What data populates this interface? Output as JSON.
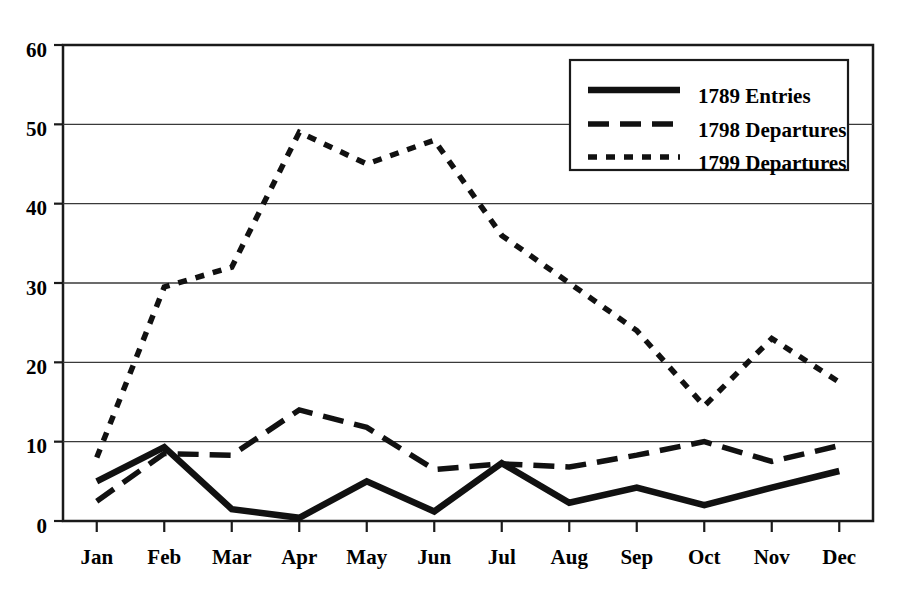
{
  "chart_data": {
    "type": "line",
    "title": "",
    "xlabel": "",
    "ylabel": "",
    "categories": [
      "Jan",
      "Feb",
      "Mar",
      "Apr",
      "May",
      "Jun",
      "Jul",
      "Aug",
      "Sep",
      "Oct",
      "Nov",
      "Dec"
    ],
    "ylim": [
      0,
      60
    ],
    "yticks": [
      0,
      10,
      20,
      30,
      40,
      50,
      60
    ],
    "grid": "horizontal",
    "legend_position": "top-right",
    "series": [
      {
        "name": "1789 Entries",
        "style": "solid",
        "color": "#111111",
        "values": [
          5.0,
          9.3,
          1.5,
          0.4,
          5.0,
          1.2,
          7.3,
          2.3,
          4.2,
          2.0,
          4.2,
          6.3
        ]
      },
      {
        "name": "1798 Departures",
        "style": "dashed",
        "color": "#111111",
        "values": [
          2.5,
          8.5,
          8.3,
          14.0,
          11.8,
          6.5,
          7.2,
          6.8,
          8.3,
          10.0,
          7.5,
          9.5
        ]
      },
      {
        "name": "1799 Departures",
        "style": "dotted",
        "color": "#111111",
        "values": [
          8.0,
          29.5,
          32.0,
          49.0,
          45.0,
          48.0,
          36.0,
          30.0,
          24.0,
          14.5,
          23.0,
          17.5
        ]
      }
    ]
  },
  "legend": {
    "entries": [
      {
        "label": "1789 Entries"
      },
      {
        "label": "1798 Departures"
      },
      {
        "label": "1799 Departures"
      }
    ]
  },
  "axes": {
    "y_tick_labels": [
      "60",
      "50",
      "40",
      "30",
      "20",
      "10",
      "0"
    ],
    "x_tick_labels": [
      "Jan",
      "Feb",
      "Mar",
      "Apr",
      "May",
      "Jun",
      "Jul",
      "Aug",
      "Sep",
      "Oct",
      "Nov",
      "Dec"
    ]
  }
}
